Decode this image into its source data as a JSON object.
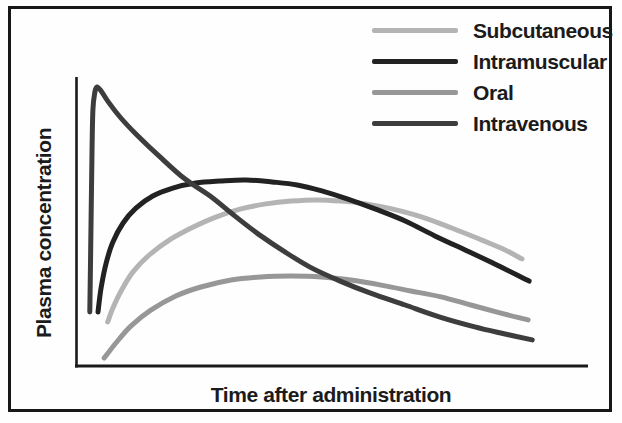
{
  "figure": {
    "background": "#fefefe",
    "frame_color": "#171717",
    "axis_color": "#1a1a1a",
    "text_color": "#1b1b1b"
  },
  "chart_data": {
    "type": "line",
    "title": "",
    "xlabel": "Time after administration",
    "ylabel": "Plasma concentration",
    "x_range_norm": [
      0,
      1
    ],
    "y_range_norm": [
      0,
      1
    ],
    "grid": false,
    "axis_ticks": "none",
    "legend_position": "top-right",
    "draw_order": [
      2,
      0,
      1,
      3
    ],
    "series": [
      {
        "name": "Subcutaneous",
        "color": "#b4b4b4",
        "points": [
          [
            0.062,
            0.157
          ],
          [
            0.072,
            0.206
          ],
          [
            0.088,
            0.267
          ],
          [
            0.111,
            0.334
          ],
          [
            0.143,
            0.395
          ],
          [
            0.182,
            0.448
          ],
          [
            0.225,
            0.491
          ],
          [
            0.273,
            0.53
          ],
          [
            0.322,
            0.559
          ],
          [
            0.371,
            0.577
          ],
          [
            0.42,
            0.587
          ],
          [
            0.469,
            0.591
          ],
          [
            0.518,
            0.587
          ],
          [
            0.566,
            0.577
          ],
          [
            0.617,
            0.559
          ],
          [
            0.676,
            0.53
          ],
          [
            0.734,
            0.491
          ],
          [
            0.793,
            0.448
          ],
          [
            0.838,
            0.413
          ],
          [
            0.871,
            0.381
          ]
        ]
      },
      {
        "name": "Intramuscular",
        "color": "#222222",
        "points": [
          [
            0.043,
            0.192
          ],
          [
            0.049,
            0.278
          ],
          [
            0.059,
            0.367
          ],
          [
            0.072,
            0.441
          ],
          [
            0.092,
            0.509
          ],
          [
            0.117,
            0.562
          ],
          [
            0.15,
            0.605
          ],
          [
            0.189,
            0.633
          ],
          [
            0.234,
            0.651
          ],
          [
            0.281,
            0.658
          ],
          [
            0.332,
            0.662
          ],
          [
            0.383,
            0.655
          ],
          [
            0.432,
            0.644
          ],
          [
            0.48,
            0.623
          ],
          [
            0.531,
            0.594
          ],
          [
            0.584,
            0.559
          ],
          [
            0.643,
            0.516
          ],
          [
            0.701,
            0.463
          ],
          [
            0.76,
            0.413
          ],
          [
            0.818,
            0.363
          ],
          [
            0.885,
            0.302
          ]
        ]
      },
      {
        "name": "Oral",
        "color": "#979797",
        "points": [
          [
            0.055,
            0.028
          ],
          [
            0.078,
            0.082
          ],
          [
            0.107,
            0.142
          ],
          [
            0.146,
            0.199
          ],
          [
            0.195,
            0.249
          ],
          [
            0.244,
            0.281
          ],
          [
            0.303,
            0.306
          ],
          [
            0.361,
            0.317
          ],
          [
            0.42,
            0.32
          ],
          [
            0.479,
            0.317
          ],
          [
            0.537,
            0.306
          ],
          [
            0.596,
            0.288
          ],
          [
            0.654,
            0.267
          ],
          [
            0.713,
            0.246
          ],
          [
            0.771,
            0.217
          ],
          [
            0.828,
            0.189
          ],
          [
            0.883,
            0.164
          ]
        ]
      },
      {
        "name": "Intravenous",
        "color": "#3d3d3d",
        "points": [
          [
            0.027,
            0.192
          ],
          [
            0.029,
            0.448
          ],
          [
            0.031,
            0.733
          ],
          [
            0.033,
            0.911
          ],
          [
            0.037,
            0.975
          ],
          [
            0.041,
            0.993
          ],
          [
            0.049,
            0.979
          ],
          [
            0.063,
            0.94
          ],
          [
            0.086,
            0.886
          ],
          [
            0.119,
            0.822
          ],
          [
            0.164,
            0.744
          ],
          [
            0.213,
            0.665
          ],
          [
            0.262,
            0.605
          ],
          [
            0.31,
            0.534
          ],
          [
            0.359,
            0.466
          ],
          [
            0.408,
            0.406
          ],
          [
            0.457,
            0.352
          ],
          [
            0.516,
            0.302
          ],
          [
            0.574,
            0.26
          ],
          [
            0.643,
            0.217
          ],
          [
            0.711,
            0.174
          ],
          [
            0.779,
            0.139
          ],
          [
            0.838,
            0.114
          ],
          [
            0.891,
            0.093
          ]
        ]
      }
    ]
  }
}
